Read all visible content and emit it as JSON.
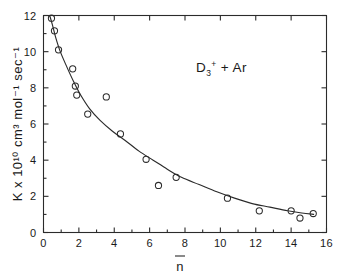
{
  "chart_data": {
    "type": "scatter",
    "title": "",
    "subtitle": "",
    "xlabel": "n̄",
    "ylabel": "K x 10¹⁰ cm³ mol⁻¹ sec⁻¹",
    "xlim": [
      0,
      16
    ],
    "ylim": [
      0,
      12
    ],
    "xticks": [
      0,
      2,
      4,
      6,
      8,
      10,
      12,
      14,
      16
    ],
    "xticklabels": [
      "0",
      "2",
      "4",
      "6",
      "8",
      "10",
      "12",
      "14",
      "16"
    ],
    "yticks": [
      0,
      2,
      4,
      6,
      8,
      10,
      12
    ],
    "yticklabels": [
      "0",
      "2",
      "4",
      "6",
      "8",
      "10",
      "12"
    ],
    "xminorticks": [
      1,
      3,
      5,
      7,
      9,
      11,
      13,
      15
    ],
    "yminorticks": [
      1,
      3,
      5,
      7,
      9,
      11
    ],
    "grid": false,
    "legend": false,
    "legend_position": "none",
    "marker": "open-circle",
    "annotations": [
      {
        "name": "reaction-label",
        "text": "D3+ + Ar",
        "text_parts": {
          "species": "D",
          "sub": "3",
          "sup": "+",
          "plus": " + ",
          "partner": "Ar"
        },
        "x": 8.6,
        "y": 9.1
      }
    ],
    "series": [
      {
        "name": "D3+ + Ar rate constant",
        "marker": "open-circle",
        "points": [
          {
            "x": 0.45,
            "y": 11.85
          },
          {
            "x": 0.62,
            "y": 11.15
          },
          {
            "x": 0.85,
            "y": 10.1
          },
          {
            "x": 1.65,
            "y": 9.05
          },
          {
            "x": 1.8,
            "y": 8.1
          },
          {
            "x": 1.88,
            "y": 7.6
          },
          {
            "x": 2.5,
            "y": 6.55
          },
          {
            "x": 3.55,
            "y": 7.5
          },
          {
            "x": 4.35,
            "y": 5.45
          },
          {
            "x": 5.8,
            "y": 4.05
          },
          {
            "x": 6.5,
            "y": 2.6
          },
          {
            "x": 7.5,
            "y": 3.05
          },
          {
            "x": 10.4,
            "y": 1.9
          },
          {
            "x": 12.2,
            "y": 1.2
          },
          {
            "x": 14.0,
            "y": 1.2
          },
          {
            "x": 14.5,
            "y": 0.8
          },
          {
            "x": 15.25,
            "y": 1.05
          }
        ]
      }
    ],
    "fit_curve": {
      "name": "decay-fit",
      "description": "smooth monotonically decreasing fitted curve",
      "points": [
        {
          "x": 0.35,
          "y": 12.0
        },
        {
          "x": 0.5,
          "y": 11.5
        },
        {
          "x": 0.7,
          "y": 10.75
        },
        {
          "x": 0.95,
          "y": 10.0
        },
        {
          "x": 1.3,
          "y": 9.2
        },
        {
          "x": 1.7,
          "y": 8.35
        },
        {
          "x": 2.1,
          "y": 7.6
        },
        {
          "x": 2.6,
          "y": 6.85
        },
        {
          "x": 3.2,
          "y": 6.2
        },
        {
          "x": 3.9,
          "y": 5.6
        },
        {
          "x": 4.6,
          "y": 5.1
        },
        {
          "x": 5.4,
          "y": 4.5
        },
        {
          "x": 6.2,
          "y": 4.0
        },
        {
          "x": 7.0,
          "y": 3.5
        },
        {
          "x": 7.8,
          "y": 3.05
        },
        {
          "x": 8.8,
          "y": 2.65
        },
        {
          "x": 9.8,
          "y": 2.25
        },
        {
          "x": 10.8,
          "y": 1.9
        },
        {
          "x": 11.8,
          "y": 1.6
        },
        {
          "x": 12.8,
          "y": 1.4
        },
        {
          "x": 13.8,
          "y": 1.2
        },
        {
          "x": 14.6,
          "y": 1.08
        },
        {
          "x": 15.3,
          "y": 1.0
        }
      ]
    },
    "colors": {
      "axis": "#2b2b2b",
      "marker": "#2b2b2b",
      "curve": "#2b2b2b",
      "background": "#ffffff",
      "text": "#1a1a1a"
    }
  }
}
